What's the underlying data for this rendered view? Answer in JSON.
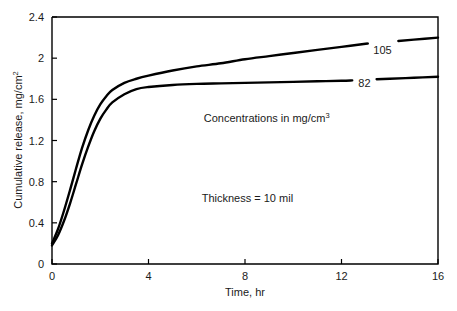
{
  "chart_data": {
    "type": "line",
    "title": "",
    "xlabel": "Time, hr",
    "ylabel": "Cumulative release, mg/cm2",
    "ylabel_base": "Cumulative release, mg/cm",
    "ylabel_sup": "2",
    "xlim": [
      0,
      16
    ],
    "ylim": [
      0,
      2.4
    ],
    "xticks": [
      0,
      4,
      8,
      12,
      16
    ],
    "yticks": [
      0,
      0.4,
      0.8,
      1.2,
      1.6,
      2,
      2.4
    ],
    "xtick_labels": [
      "0",
      "4",
      "8",
      "12",
      "16"
    ],
    "ytick_labels": [
      "0",
      "0.4",
      "0.8",
      "1.2",
      "1.6",
      "2",
      "2.4"
    ],
    "grid": false,
    "legend_position": "inline-curve-labels",
    "line_color": "#000000",
    "axis_color": "#000000",
    "background_color": "#ffffff",
    "series": [
      {
        "name": "105",
        "label": "105",
        "x": [
          0,
          0.25,
          0.5,
          0.75,
          1,
          1.25,
          1.5,
          1.75,
          2,
          2.25,
          2.5,
          3,
          3.5,
          4,
          5,
          6,
          7,
          8,
          9,
          10,
          11,
          12,
          13,
          14,
          15,
          16
        ],
        "values": [
          0.2,
          0.34,
          0.52,
          0.72,
          0.93,
          1.13,
          1.3,
          1.44,
          1.55,
          1.63,
          1.69,
          1.76,
          1.8,
          1.83,
          1.88,
          1.92,
          1.95,
          1.99,
          2.02,
          2.05,
          2.08,
          2.11,
          2.14,
          2.16,
          2.18,
          2.2
        ]
      },
      {
        "name": "82",
        "label": "82",
        "x": [
          0,
          0.25,
          0.5,
          0.75,
          1,
          1.25,
          1.5,
          1.75,
          2,
          2.25,
          2.5,
          3,
          3.5,
          4,
          5,
          6,
          7,
          8,
          9,
          10,
          11,
          12,
          13,
          14,
          15,
          16
        ],
        "values": [
          0.18,
          0.28,
          0.42,
          0.59,
          0.78,
          0.97,
          1.14,
          1.29,
          1.41,
          1.5,
          1.57,
          1.65,
          1.7,
          1.72,
          1.74,
          1.75,
          1.755,
          1.76,
          1.765,
          1.77,
          1.775,
          1.78,
          1.79,
          1.8,
          1.81,
          1.82
        ]
      }
    ],
    "annotations": [
      {
        "text": "Concentrations in mg/cm3",
        "text_base": "Concentrations in mg/cm",
        "text_sup": "3",
        "x": 8.9,
        "y": 1.38
      },
      {
        "text": "Thickness = 10 mil",
        "text_base": "Thickness = 10 mil",
        "text_sup": "",
        "x": 8.1,
        "y": 0.6
      }
    ],
    "curve_labels": [
      {
        "text": "105",
        "x": 13.7,
        "y": 2.08
      },
      {
        "text": "82",
        "x": 12.95,
        "y": 1.755
      }
    ]
  }
}
